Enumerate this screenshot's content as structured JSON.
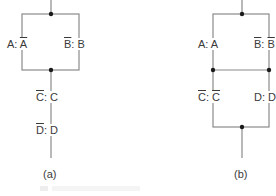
{
  "diagram_a": {
    "caption": "(a)",
    "left_branch": {
      "pre": "A",
      "sep": ": ",
      "post": "A",
      "post_overline": true,
      "pre_overline": false
    },
    "right_branch": {
      "pre": "B",
      "sep": ": ",
      "post": "B",
      "pre_overline": true,
      "post_overline": false
    },
    "series_1": {
      "pre": "C",
      "sep": ": ",
      "post": "C",
      "pre_overline": true,
      "post_overline": false
    },
    "series_2": {
      "pre": "D",
      "sep": ": ",
      "post": "D",
      "pre_overline": true,
      "post_overline": false
    }
  },
  "diagram_b": {
    "caption": "(b)",
    "top_left": {
      "pre": "A",
      "sep": ": ",
      "post": "A",
      "pre_overline": false,
      "post_overline": false
    },
    "top_right": {
      "pre": "B",
      "sep": ": ",
      "post": "B",
      "pre_overline": true,
      "post_overline": true
    },
    "bottom_left": {
      "pre": "C",
      "sep": ": ",
      "post": "C",
      "pre_overline": true,
      "post_overline": true
    },
    "bottom_right": {
      "pre": "D",
      "sep": ": ",
      "post": "D",
      "pre_overline": false,
      "post_overline": false
    }
  },
  "colors": {
    "line": "#8a8a8a",
    "node": "#1a1a1a",
    "text": "#3a3a3a"
  }
}
